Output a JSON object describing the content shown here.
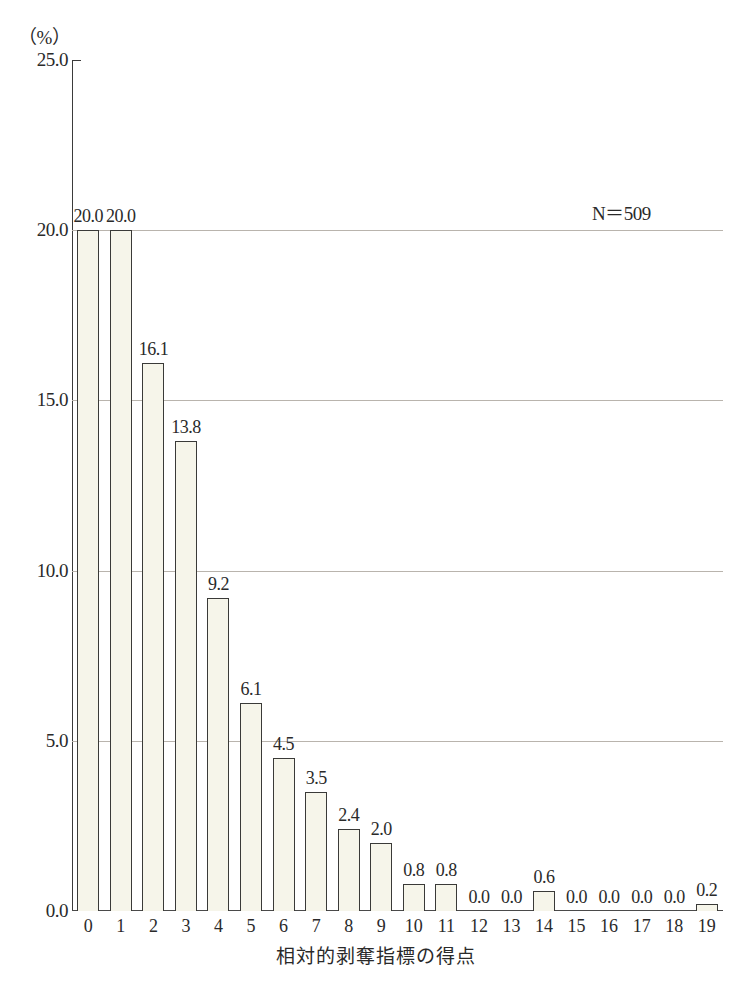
{
  "chart_data": {
    "type": "bar",
    "title": "",
    "subtitle": "",
    "unit_label": "（%）",
    "xlabel": "相対的剥奪指標の得点",
    "ylabel": "",
    "categories": [
      "0",
      "1",
      "2",
      "3",
      "4",
      "5",
      "6",
      "7",
      "8",
      "9",
      "10",
      "11",
      "12",
      "13",
      "14",
      "15",
      "16",
      "17",
      "18",
      "19"
    ],
    "values": [
      20.0,
      20.0,
      16.1,
      13.8,
      9.2,
      6.1,
      4.5,
      3.5,
      2.4,
      2.0,
      0.8,
      0.8,
      0.0,
      0.0,
      0.6,
      0.0,
      0.0,
      0.0,
      0.0,
      0.2
    ],
    "value_labels": [
      "20.0",
      "20.0",
      "16.1",
      "13.8",
      "9.2",
      "6.1",
      "4.5",
      "3.5",
      "2.4",
      "2.0",
      "0.8",
      "0.8",
      "0.0",
      "0.0",
      "0.6",
      "0.0",
      "0.0",
      "0.0",
      "0.0",
      "0.2"
    ],
    "ylim": [
      0.0,
      25.0
    ],
    "yticks": [
      0.0,
      5.0,
      10.0,
      15.0,
      20.0,
      25.0
    ],
    "ytick_labels": [
      "0.0",
      "5.0",
      "10.0",
      "15.0",
      "20.0",
      "25.0"
    ],
    "gridlines_at": [
      5.0,
      10.0,
      15.0,
      20.0
    ],
    "grid": true,
    "legend": "none",
    "annotations": [
      {
        "name": "sample-size",
        "text": "N＝509"
      }
    ],
    "colors": {
      "bar_fill": "#f6f5ea",
      "bar_border": "#3a3a38",
      "gridline": "#b9b4ad",
      "axis": "#3b3b3b",
      "text": "#2a2a2a",
      "background": "#ffffff"
    }
  }
}
